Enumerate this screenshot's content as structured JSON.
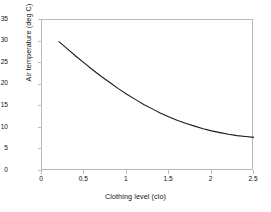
{
  "chart_data": {
    "type": "line",
    "title": "",
    "xlabel": "Clothing level (clo)",
    "ylabel": "Air temperature (deg C)",
    "xlim": [
      0,
      2.5
    ],
    "ylim": [
      0,
      35
    ],
    "xticks": [
      "0",
      "0.5",
      "1",
      "1.5",
      "2",
      "2.5"
    ],
    "xtick_values": [
      0,
      0.5,
      1,
      1.5,
      2,
      2.5
    ],
    "yticks": [
      "0",
      "5",
      "10",
      "15",
      "20",
      "25",
      "30",
      "35"
    ],
    "ytick_values": [
      0,
      5,
      10,
      15,
      20,
      25,
      30,
      35
    ],
    "grid": false,
    "legend": null,
    "series": [
      {
        "name": "Air temperature",
        "color": "#1a1a1a",
        "x": [
          0.2,
          0.3,
          0.4,
          0.5,
          0.6,
          0.7,
          0.8,
          0.9,
          1.0,
          1.1,
          1.2,
          1.3,
          1.4,
          1.5,
          1.6,
          1.7,
          1.8,
          1.9,
          2.0,
          2.1,
          2.2,
          2.3,
          2.4,
          2.5
        ],
        "y": [
          30.0,
          28.3,
          26.6,
          25.0,
          23.4,
          21.9,
          20.5,
          19.1,
          17.8,
          16.6,
          15.4,
          14.4,
          13.4,
          12.5,
          11.7,
          11.0,
          10.4,
          9.8,
          9.3,
          8.9,
          8.5,
          8.2,
          8.0,
          7.8
        ]
      }
    ]
  },
  "figure": {
    "background": "#ffffff",
    "frame_color": "#b9b9b9",
    "tick_color": "#bcbcbc",
    "text_color": "#111111"
  }
}
